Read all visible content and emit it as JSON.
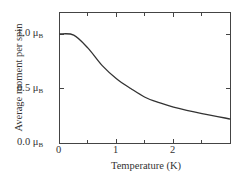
{
  "chart_data": {
    "type": "line",
    "title": "",
    "xlabel": "Temperature (K)",
    "ylabel": "Average moment per spin",
    "xlim": [
      0,
      3.0
    ],
    "ylim": [
      0,
      1.2
    ],
    "x_ticks": [
      "0",
      "1",
      "2"
    ],
    "y_ticks": [
      "0.0 μB",
      "0.5 μB",
      "1.0 μB"
    ],
    "grid": false,
    "legend": null,
    "series": [
      {
        "name": "average moment",
        "x": [
          0,
          0.25,
          0.5,
          0.75,
          1.0,
          1.25,
          1.5,
          1.75,
          2.0,
          2.5,
          3.0
        ],
        "values": [
          1.0,
          0.99,
          0.87,
          0.71,
          0.59,
          0.5,
          0.42,
          0.37,
          0.33,
          0.27,
          0.22
        ]
      }
    ]
  },
  "labels": {
    "y_tick_0": "0.0 μ",
    "y_tick_1": "0.5 μ",
    "y_tick_2": "1.0 μ",
    "unit_sub": "B",
    "x_tick_0": "0",
    "x_tick_1": "1",
    "x_tick_2": "2",
    "xlabel": "Temperature (K)",
    "ylabel": "Average moment per spin"
  }
}
